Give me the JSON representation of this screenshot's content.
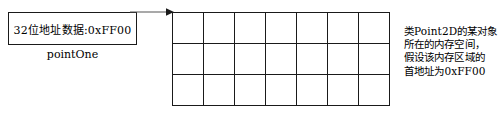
{
  "diagram": {
    "pointer_box": {
      "text": "32位地址数据:0xFF00",
      "label": "pointOne"
    },
    "arrow": {
      "name": "points-to-arrow"
    },
    "memory_grid": {
      "columns": 7,
      "rows": 3,
      "cell_width": 31,
      "cell_height": 31,
      "cells": [
        [
          "",
          "",
          "",
          "",
          "",
          "",
          ""
        ],
        [
          "",
          "",
          "",
          "",
          "",
          "",
          ""
        ],
        [
          "",
          "",
          "",
          "",
          "",
          "",
          ""
        ]
      ]
    },
    "annotation": {
      "lines": [
        "类Point2D的某对象",
        "所在的内存空间，",
        "假设该内存区域的",
        "首地址为0xFF00"
      ]
    },
    "colors": {
      "stroke": "#1a1a1a",
      "background": "#ffffff",
      "text": "#000000"
    }
  }
}
